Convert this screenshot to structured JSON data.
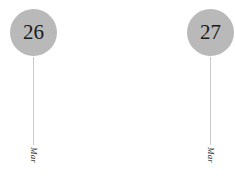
{
  "widget": {
    "type": "date-timeline-axis",
    "background_color": "#ffffff",
    "marker_fill_color": "#b9b9b9",
    "marker_text_color": "#1a1a1a",
    "tick_line_color": "#c9c9c9",
    "month_label_color": "#333333"
  },
  "ticks": [
    {
      "day": "26",
      "month": "Mar",
      "left": 4
    },
    {
      "day": "27",
      "month": "Mar",
      "left": 181
    }
  ]
}
